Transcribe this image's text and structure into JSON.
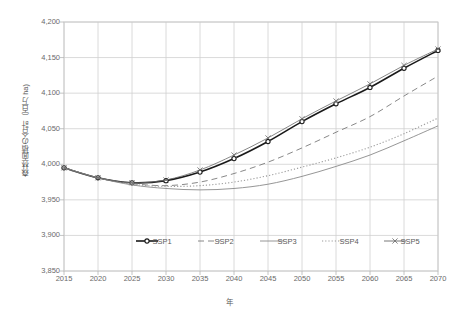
{
  "chart_data": {
    "type": "line",
    "title": "",
    "xlabel": "年",
    "ylabel": "森林面積の合計（百万 ha)",
    "x": [
      2015,
      2020,
      2025,
      2030,
      2035,
      2040,
      2045,
      2050,
      2055,
      2060,
      2065,
      2070
    ],
    "xlim": [
      2015,
      2070
    ],
    "ylim": [
      3850,
      4200
    ],
    "ytick_labels": [
      "4,200",
      "4,150",
      "4,100",
      "4,050",
      "4,000",
      "3,950",
      "3,900",
      "3,850"
    ],
    "ytick_values": [
      4200,
      4150,
      4100,
      4050,
      4000,
      3950,
      3900,
      3850
    ],
    "xtick_labels": [
      "2015",
      "2020",
      "2025",
      "2030",
      "2035",
      "2040",
      "2045",
      "2050",
      "2055",
      "2060",
      "2065",
      "2070"
    ],
    "grid": true,
    "legend_position": "inside-bottom-center",
    "series": [
      {
        "name": "SSP1",
        "style": "solid-marker-circle",
        "color": "#1a1a1a",
        "values": [
          3995,
          3981,
          3974,
          3977,
          3989,
          4008,
          4032,
          4060,
          4085,
          4108,
          4135,
          4160
        ]
      },
      {
        "name": "SSP2",
        "style": "dashed",
        "color": "#7a7a7a",
        "values": [
          3995,
          3981,
          3973,
          3970,
          3975,
          3987,
          4003,
          4023,
          4045,
          4067,
          4096,
          4124
        ]
      },
      {
        "name": "SSP3",
        "style": "solid",
        "color": "#8a8a8a",
        "values": [
          3995,
          3981,
          3971,
          3966,
          3964,
          3966,
          3972,
          3983,
          3997,
          4013,
          4033,
          4054
        ]
      },
      {
        "name": "SSP4",
        "style": "dotted",
        "color": "#9a9a9a",
        "values": [
          3995,
          3981,
          3972,
          3969,
          3970,
          3975,
          3984,
          3996,
          4009,
          4024,
          4043,
          4065
        ]
      },
      {
        "name": "SSP5",
        "style": "solid-marker-x",
        "color": "#6a6a6a",
        "values": [
          3995,
          3981,
          3974,
          3978,
          3992,
          4013,
          4037,
          4064,
          4089,
          4113,
          4139,
          4162
        ]
      }
    ]
  },
  "legend": {
    "items": [
      {
        "label": "SSP1"
      },
      {
        "label": "SSP2"
      },
      {
        "label": "SSP3"
      },
      {
        "label": "SSP4"
      },
      {
        "label": "SSP5"
      }
    ]
  }
}
